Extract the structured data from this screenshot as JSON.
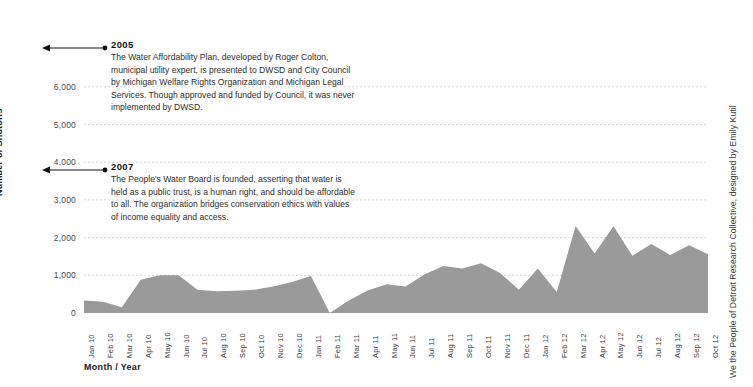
{
  "chart_data": {
    "type": "area",
    "title": "",
    "xlabel": "Month / Year",
    "ylabel": "Number of Shutoffs",
    "ylim": [
      0,
      6500
    ],
    "yticks": [
      0,
      1000,
      2000,
      3000,
      4000,
      5000,
      6000
    ],
    "ytick_labels": [
      "0",
      "1,000",
      "2,000",
      "3,000",
      "4,000",
      "5,000",
      "6,000"
    ],
    "grid": true,
    "legend": "none",
    "series_color": "#9a9a9a",
    "categories": [
      "Jan 10",
      "Feb 10",
      "Mar 10",
      "Apr 10",
      "May 10",
      "Jun 10",
      "Jul 10",
      "Aug 10",
      "Sep 10",
      "Oct 10",
      "Nov 10",
      "Dec 10",
      "Jan 11",
      "Feb 11",
      "Mar 11",
      "Apr 11",
      "May 11",
      "Jun 11",
      "Jul 11",
      "Aug 11",
      "Sep 11",
      "Oct 11",
      "Nov 11",
      "Dec 11",
      "Jan 12",
      "Feb 12",
      "Mar 12",
      "Apr 12",
      "May 12",
      "Jun 12",
      "Jul 12",
      "Aug 12",
      "Sep 12",
      "Oct 12"
    ],
    "values": [
      330,
      300,
      150,
      880,
      1000,
      1000,
      620,
      580,
      590,
      620,
      700,
      820,
      980,
      0,
      330,
      600,
      760,
      700,
      1020,
      1250,
      1180,
      1320,
      1060,
      620,
      1180,
      560,
      2310,
      1580,
      2300,
      1520,
      1830,
      1540,
      1800,
      1560
    ],
    "series_name": "Number of Shutoffs"
  },
  "annotations": [
    {
      "year": "2005",
      "text": "The Water Affordability Plan, developed by Roger Colton, municipal utility expert, is presented to DWSD and City Council by Michigan Welfare Rights Organization and Michigan Legal Services. Though approved and funded by Council, it was never implemented by DWSD."
    },
    {
      "year": "2007",
      "text": "The People's Water Board is founded, asserting that water is held as a public trust, is a human right, and should be affordable to all. The organization bridges conservation ethics with values of income equality and access."
    }
  ],
  "credit": "We the People of Detroit Research Collective, designed by Emily Kutil"
}
